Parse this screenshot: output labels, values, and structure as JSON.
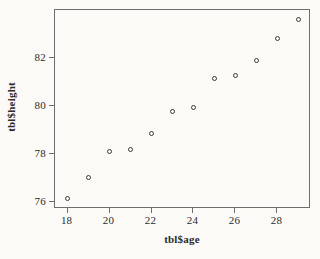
{
  "chart_data": {
    "type": "scatter",
    "title": "",
    "xlabel": "tbl$age",
    "ylabel": "tbl$height",
    "xlim": [
      17.4,
      29.6
    ],
    "ylim": [
      75.7,
      84.0
    ],
    "xticks": [
      18,
      20,
      22,
      24,
      26,
      28
    ],
    "xticklabels": [
      "18",
      "20",
      "22",
      "24",
      "26",
      "28"
    ],
    "yticks": [
      76,
      78,
      80,
      82
    ],
    "yticklabels": [
      "76",
      "78",
      "80",
      "82"
    ],
    "grid": false,
    "legend": null,
    "marker": "open-circle",
    "marker_color": "#3a3a3a",
    "background_color": "#fbfaf7",
    "axis_color": "#6e6e6e",
    "n_points": 12,
    "x": [
      18,
      19,
      20,
      21,
      22,
      23,
      24,
      25,
      26,
      27,
      28,
      29
    ],
    "y": [
      76.15,
      77.0,
      78.1,
      78.2,
      78.85,
      79.75,
      79.95,
      81.15,
      81.25,
      81.9,
      82.8,
      83.6
    ],
    "points": [
      {
        "x": 18,
        "y": 76.15
      },
      {
        "x": 19,
        "y": 77.0
      },
      {
        "x": 20,
        "y": 78.1
      },
      {
        "x": 21,
        "y": 78.2
      },
      {
        "x": 22,
        "y": 78.85
      },
      {
        "x": 23,
        "y": 79.75
      },
      {
        "x": 24,
        "y": 79.95
      },
      {
        "x": 25,
        "y": 81.15
      },
      {
        "x": 26,
        "y": 81.25
      },
      {
        "x": 27,
        "y": 81.9
      },
      {
        "x": 28,
        "y": 82.8
      },
      {
        "x": 29,
        "y": 83.6
      }
    ]
  }
}
